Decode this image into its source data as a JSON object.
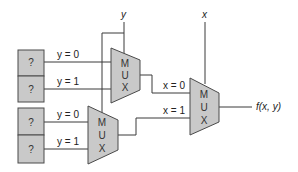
{
  "diagram": {
    "type": "multiplexer-tree",
    "inputs": {
      "top_mux": [
        {
          "label": "?",
          "select_label": "y = 0"
        },
        {
          "label": "?",
          "select_label": "y = 1"
        }
      ],
      "bottom_mux": [
        {
          "label": "?",
          "select_label": "y = 0"
        },
        {
          "label": "?",
          "select_label": "y = 1"
        }
      ]
    },
    "muxes": [
      {
        "id": "mux-top",
        "letters": [
          "M",
          "U",
          "X"
        ],
        "select": "y"
      },
      {
        "id": "mux-bottom",
        "letters": [
          "M",
          "U",
          "X"
        ],
        "select": "y"
      },
      {
        "id": "mux-final",
        "letters": [
          "M",
          "U",
          "X"
        ],
        "select": "x"
      }
    ],
    "final_inputs": [
      {
        "select_label": "x = 0"
      },
      {
        "select_label": "x = 1"
      }
    ],
    "select_signals": {
      "y": "y",
      "x": "x"
    },
    "output_label": "f(x, y)"
  },
  "colors": {
    "fill": "#c9c9c9",
    "stroke": "#4a4a4a"
  }
}
